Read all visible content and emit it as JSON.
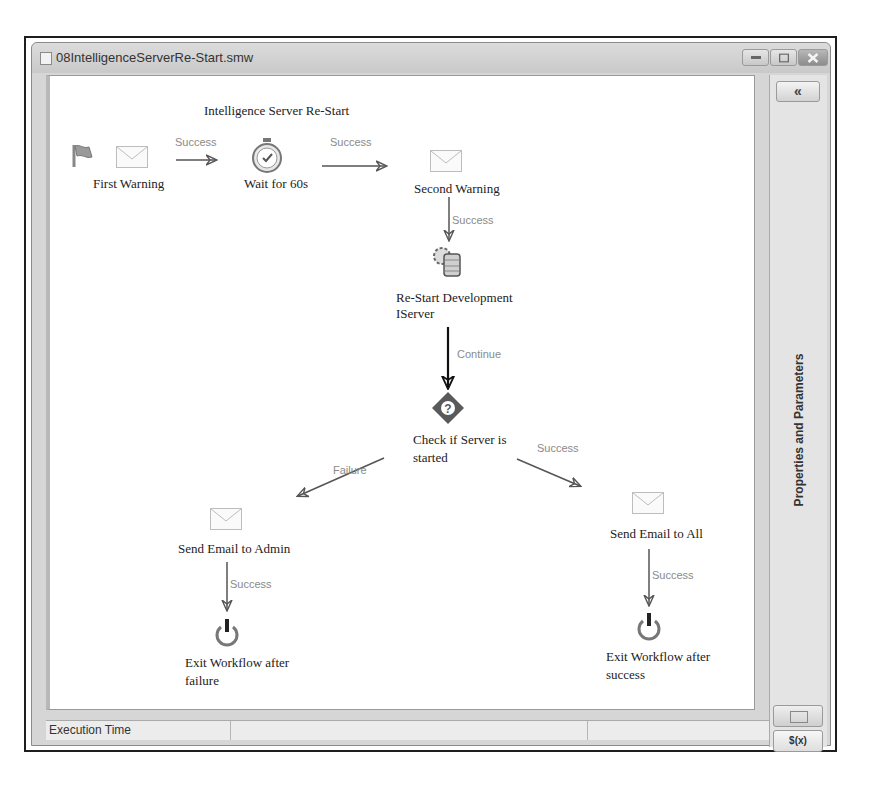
{
  "window": {
    "title": "08IntelligenceServerRe-Start.smw",
    "controls": {
      "minimize": "–",
      "maximize": "□",
      "close": "✕"
    }
  },
  "diagram": {
    "title": "Intelligence Server Re-Start",
    "nodes": [
      {
        "id": "first_warning",
        "label": "First Warning",
        "icon": "envelope-icon",
        "start": true
      },
      {
        "id": "wait",
        "label": "Wait for 60s",
        "icon": "stopwatch-icon"
      },
      {
        "id": "second_warning",
        "label": "Second Warning",
        "icon": "envelope-icon"
      },
      {
        "id": "restart",
        "label_line1": "Re-Start Development",
        "label_line2": "IServer",
        "icon": "server-gear-icon"
      },
      {
        "id": "check",
        "label_line1": "Check if Server is",
        "label_line2": "started",
        "icon": "decision-diamond-icon"
      },
      {
        "id": "email_admin",
        "label": "Send Email to Admin",
        "icon": "envelope-icon"
      },
      {
        "id": "email_all",
        "label": "Send Email to All",
        "icon": "envelope-icon"
      },
      {
        "id": "exit_failure",
        "label_line1": "Exit Workflow after",
        "label_line2": "failure",
        "icon": "power-icon"
      },
      {
        "id": "exit_success",
        "label_line1": "Exit Workflow after",
        "label_line2": "success",
        "icon": "power-icon"
      }
    ],
    "edges": [
      {
        "from": "first_warning",
        "to": "wait",
        "label": "Success"
      },
      {
        "from": "wait",
        "to": "second_warning",
        "label": "Success"
      },
      {
        "from": "second_warning",
        "to": "restart",
        "label": "Success"
      },
      {
        "from": "restart",
        "to": "check",
        "label": "Continue"
      },
      {
        "from": "check",
        "to": "email_admin",
        "label": "Failure"
      },
      {
        "from": "check",
        "to": "email_all",
        "label": "Success"
      },
      {
        "from": "email_admin",
        "to": "exit_failure",
        "label": "Success"
      },
      {
        "from": "email_all",
        "to": "exit_success",
        "label": "Success"
      }
    ]
  },
  "side_panel": {
    "collapse_label": "«",
    "title": "Properties and Parameters",
    "function_button": "$(x)"
  },
  "statusbar": {
    "execution_time_label": "Execution Time",
    "cell2": "",
    "cell3": ""
  }
}
